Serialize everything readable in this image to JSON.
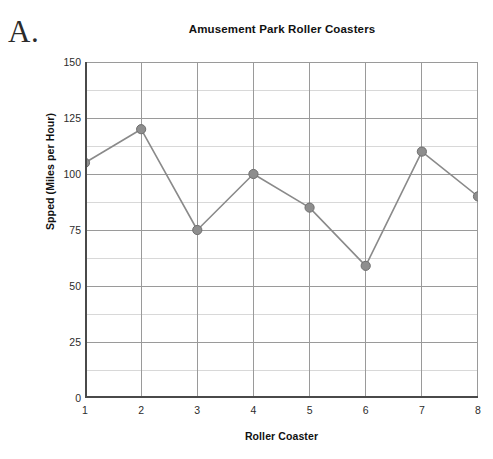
{
  "figure": {
    "label": "A."
  },
  "chart_data": {
    "type": "line",
    "title": "Amusement Park Roller Coasters",
    "xlabel": "Roller Coaster",
    "ylabel": "Spped (Miles per Hour)",
    "categories": [
      "1",
      "2",
      "3",
      "4",
      "5",
      "6",
      "7",
      "8"
    ],
    "x": [
      1,
      2,
      3,
      4,
      5,
      6,
      7,
      8
    ],
    "values": [
      105,
      120,
      75,
      100,
      85,
      59,
      110,
      90
    ],
    "xlim": [
      1,
      8
    ],
    "ylim": [
      0,
      150
    ],
    "y_ticks": [
      "0",
      "25",
      "50",
      "75",
      "100",
      "125",
      "150"
    ],
    "y_tick_values": [
      0,
      25,
      50,
      75,
      100,
      125,
      150
    ],
    "y_minor_step": 12.5,
    "x_ticks": [
      "1",
      "2",
      "3",
      "4",
      "5",
      "6",
      "7",
      "8"
    ],
    "grid": "major and minor horizontal, major vertical",
    "legend": "none",
    "marker": "circle",
    "colors": {
      "line": "#8a8a8a",
      "marker": "#8e8e8e",
      "marker_edge": "#6f6f6f",
      "major_grid": "#9a9a9a",
      "minor_grid": "#d8d8d8",
      "axis": "#4a4a4a",
      "text": "#1a1a1a"
    }
  }
}
